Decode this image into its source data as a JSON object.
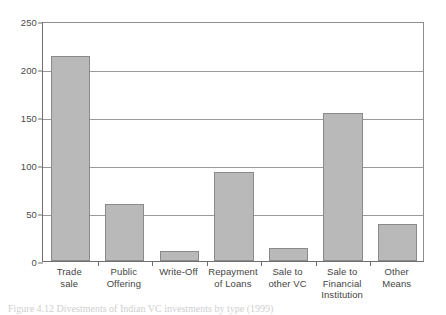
{
  "figure": {
    "caption": "Figure 4.12 Divestments of Indian VC investments by type (1999)"
  },
  "chart_data": {
    "type": "bar",
    "title": "",
    "xlabel": "",
    "ylabel": "",
    "ylim": [
      0,
      250
    ],
    "yticks": [
      0,
      50,
      100,
      150,
      200,
      250
    ],
    "ytick_labels": [
      "0",
      "50",
      "100",
      "150",
      "200",
      "250"
    ],
    "grid": true,
    "legend": "none",
    "bar_color": "#b9b9b9",
    "bar_border_color": "#8a8a8a",
    "axis_color": "#6f6f6f",
    "categories": [
      "Trade sale",
      "Public Offering",
      "Write-Off",
      "Repayment of Loans",
      "Sale to other VC",
      "Sale to Financial Institution",
      "Other Means"
    ],
    "category_lines": [
      [
        "Trade",
        "sale"
      ],
      [
        "Public",
        "Offering"
      ],
      [
        "Write-Off"
      ],
      [
        "Repayment",
        "of Loans"
      ],
      [
        "Sale to",
        "other VC"
      ],
      [
        "Sale to",
        "Financial",
        "Institution"
      ],
      [
        "Other Means"
      ]
    ],
    "values": [
      214,
      59,
      10,
      93,
      14,
      154,
      39
    ]
  }
}
